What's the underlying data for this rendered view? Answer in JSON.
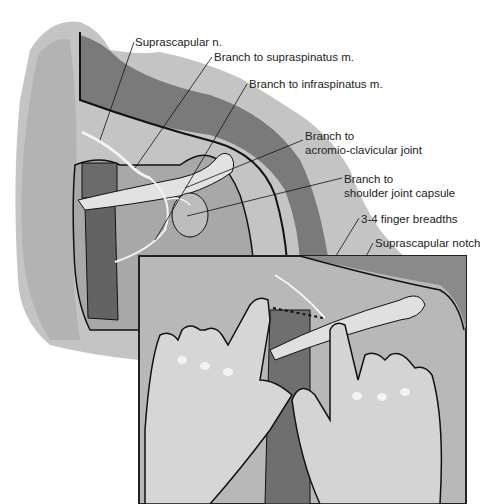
{
  "figure": {
    "labels": [
      {
        "id": "suprascapular-n",
        "text": "Suprascapular n.",
        "x": 135,
        "y": 37
      },
      {
        "id": "branch-supraspinatus",
        "text": "Branch to supraspinatus m.",
        "x": 214,
        "y": 52
      },
      {
        "id": "branch-infraspinatus",
        "text": "Branch to infraspinatus m.",
        "x": 249,
        "y": 78
      },
      {
        "id": "branch-ac-joint",
        "line1": "Branch to",
        "line2": "acromio-clavicular joint",
        "x": 305,
        "y": 130
      },
      {
        "id": "branch-shoulder-capsule",
        "line1": "Branch to",
        "line2": "shoulder joint capsule",
        "x": 344,
        "y": 172
      },
      {
        "id": "finger-breadths",
        "text": "3-4 finger breadths",
        "x": 361,
        "y": 212
      },
      {
        "id": "suprascapular-notch",
        "text": "Suprascapular notch",
        "x": 375,
        "y": 237
      }
    ],
    "colors": {
      "outline": "#111111",
      "skin_light": "#c9c9c9",
      "skin_mid": "#a6a6a6",
      "skin_dark": "#7d7d7d",
      "muscle": "#6e6e6e",
      "bone": "#dedede",
      "nerve": "#f2f2f2",
      "inset_border": "#222222"
    },
    "inset": {
      "x": 139,
      "y": 256,
      "w": 327,
      "h": 248
    }
  }
}
